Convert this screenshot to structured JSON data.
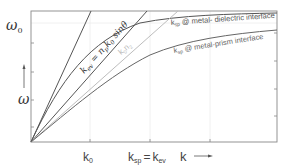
{
  "diagram": {
    "type": "dispersion-relation",
    "y_axis": {
      "symbol": "ω",
      "top_label": "ω",
      "top_label_sub": "0",
      "arrow": "up"
    },
    "x_axis": {
      "symbol": "k",
      "arrow": "right",
      "tick_labels": [
        {
          "main": "k",
          "sub": "0"
        },
        {
          "main": "k",
          "sub": "sp",
          "eq": "=",
          "main2": "k",
          "sub2": "ev"
        }
      ]
    },
    "curves": [
      {
        "name": "light-line",
        "label": ""
      },
      {
        "name": "evanescent-line",
        "label_main": "k",
        "label_sub": "ev",
        "label_rest": " = n",
        "label_sub2": "p",
        "label_rest2": "k",
        "label_sub3": "0",
        "label_rest3": " sinθ"
      },
      {
        "name": "kn2-line",
        "label_main": "k",
        "label_sub": "0",
        "label_rest": "n",
        "label_sub2": "2"
      },
      {
        "name": "sp-metal-dielectric",
        "label_main": "k",
        "label_sub": "sp",
        "label_rest": " @ metal- dielectric interface"
      },
      {
        "name": "sp-metal-prism",
        "label_main": "k",
        "label_sub": "sp",
        "label_rest": " @ metal-prism interface"
      }
    ],
    "colors": {
      "frame": "#888888",
      "grid": "#e6e6e6",
      "dark_curve": "#555555",
      "light_curve": "#bdbdbd"
    }
  }
}
